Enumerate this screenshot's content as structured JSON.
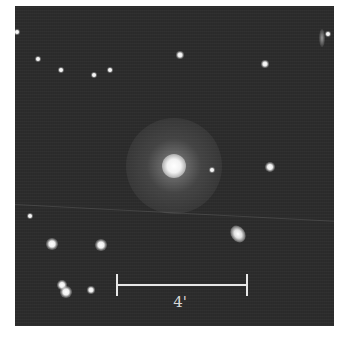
{
  "image": {
    "description": "Deep sky image of an elliptical galaxy with a companion galaxy and field stars",
    "background_color": "#2c2c2c",
    "frame": {
      "x": 15,
      "y": 6,
      "width": 319,
      "height": 320
    }
  },
  "objects": {
    "main_galaxy": {
      "x": 159,
      "y": 160,
      "core_radius": 12,
      "halo_radius": 48
    },
    "companion_galaxy": {
      "x": 223,
      "y": 228,
      "rx": 7,
      "ry": 9,
      "angle": -35
    },
    "edge_galaxy": {
      "x": 307,
      "y": 32,
      "rx": 3,
      "ry": 9
    },
    "stars": [
      {
        "x": 165,
        "y": 49,
        "r": 4
      },
      {
        "x": 23,
        "y": 53,
        "r": 3
      },
      {
        "x": 46,
        "y": 64,
        "r": 3
      },
      {
        "x": 79,
        "y": 69,
        "r": 3
      },
      {
        "x": 95,
        "y": 64,
        "r": 3
      },
      {
        "x": 250,
        "y": 58,
        "r": 4
      },
      {
        "x": 313,
        "y": 28,
        "r": 3
      },
      {
        "x": 197,
        "y": 164,
        "r": 3
      },
      {
        "x": 255,
        "y": 161,
        "r": 5
      },
      {
        "x": 15,
        "y": 210,
        "r": 3
      },
      {
        "x": 37,
        "y": 238,
        "r": 6
      },
      {
        "x": 86,
        "y": 239,
        "r": 6
      },
      {
        "x": 47,
        "y": 279,
        "r": 5
      },
      {
        "x": 51,
        "y": 286,
        "r": 6
      },
      {
        "x": 76,
        "y": 284,
        "r": 4
      },
      {
        "x": 2,
        "y": 26,
        "r": 3
      }
    ]
  },
  "scale_bar": {
    "label": "4'",
    "x1": 102,
    "x2": 232,
    "y": 279,
    "tick_height": 22,
    "label_x": 165,
    "label_y": 287
  }
}
